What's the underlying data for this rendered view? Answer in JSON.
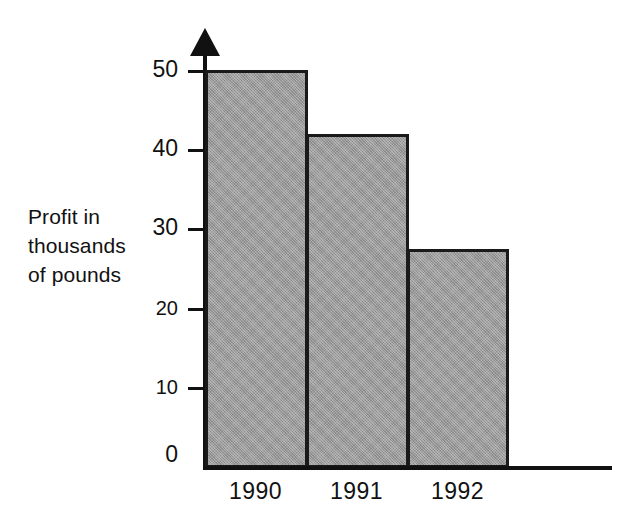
{
  "chart_data": {
    "type": "bar",
    "title": "",
    "subtitle": "",
    "xlabel": "",
    "ylabel": "Profit in thousands of pounds",
    "ylabel_lines": [
      "Profit in",
      "thousands",
      "of pounds"
    ],
    "categories": [
      "1990",
      "1991",
      "1992"
    ],
    "values": [
      50,
      42,
      27.5
    ],
    "series": [
      {
        "name": "Profit",
        "values": [
          50,
          42,
          27.5
        ]
      }
    ],
    "ylim": [
      0,
      50
    ],
    "y_ticks": [
      0,
      10,
      20,
      30,
      40,
      50
    ],
    "y_tick_labels": [
      "0",
      "10",
      "20",
      "30",
      "40",
      "50"
    ],
    "grid": false,
    "legend": false,
    "legend_position": "none",
    "bar_fill_color": "#9a9a9a",
    "bar_border_color": "#1a1a1a",
    "axis_color": "#111111",
    "background_color": "#ffffff",
    "y_axis_arrow": true,
    "bars_adjacent": true,
    "annotations": []
  }
}
